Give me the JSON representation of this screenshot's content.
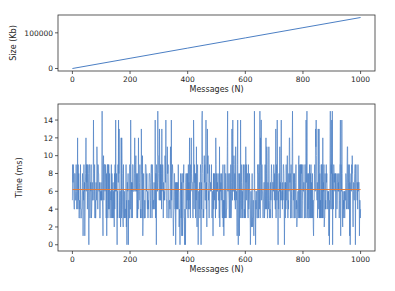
{
  "chart_data": [
    {
      "type": "line",
      "id": "size-chart",
      "title": "",
      "xlabel": "Messages (N)",
      "ylabel": "Size (Kb)",
      "xlim": [
        -50,
        1050
      ],
      "ylim": [
        -7000,
        150000
      ],
      "xticks": [
        0,
        200,
        400,
        600,
        800,
        1000
      ],
      "yticks": [
        0,
        100000
      ],
      "grid": false,
      "legend": null,
      "series": [
        {
          "name": "size",
          "color": "#4c7fc4",
          "x": [
            0,
            200,
            400,
            600,
            800,
            1000
          ],
          "y": [
            0,
            28600,
            57200,
            85800,
            114400,
            143000
          ]
        }
      ]
    },
    {
      "type": "line",
      "id": "time-chart",
      "title": "",
      "xlabel": "Messages (N)",
      "ylabel": "Time (ms)",
      "xlim": [
        -50,
        1050
      ],
      "ylim": [
        -0.7,
        15.8
      ],
      "xticks": [
        0,
        200,
        400,
        600,
        800,
        1000
      ],
      "yticks": [
        0,
        2,
        4,
        6,
        8,
        10,
        12,
        14
      ],
      "grid": false,
      "legend": null,
      "series": [
        {
          "name": "time",
          "color": "#4c7fc4",
          "description": "Noisy per-message time, integer ms values ranging 0–15, dense band mostly between ~3 and ~9",
          "n_points": 1000,
          "min": 0,
          "max": 15,
          "typical_range": [
            3,
            9
          ],
          "x_range": [
            0,
            1000
          ]
        },
        {
          "name": "mean",
          "color": "#e07b39",
          "x": [
            0,
            1000
          ],
          "y": [
            6.2,
            6.2
          ]
        }
      ]
    }
  ]
}
